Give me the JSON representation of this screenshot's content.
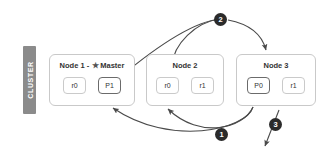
{
  "diagram": {
    "cluster_label": "CLUSTER",
    "colors": {
      "cluster_bar": "#8b8b8b",
      "node_border": "#c9c9c9",
      "primary_shard_border": "#6b6b6b",
      "replica_shard_border": "#cacaca",
      "arrow": "#4a4a4a",
      "marker_fill": "#2b2b2b",
      "marker_text": "#ffffff",
      "background": "#ffffff"
    },
    "nodes": [
      {
        "id": "node-1",
        "title": "Node 1 - ",
        "star": "★",
        "role": "Master",
        "shards": [
          {
            "label": "r0",
            "type": "replica"
          },
          {
            "label": "P1",
            "type": "primary"
          }
        ]
      },
      {
        "id": "node-2",
        "title": "Node 2",
        "star": "",
        "role": "",
        "shards": [
          {
            "label": "r0",
            "type": "replica"
          },
          {
            "label": "r1",
            "type": "replica"
          }
        ]
      },
      {
        "id": "node-3",
        "title": "Node 3",
        "star": "",
        "role": "",
        "shards": [
          {
            "label": "P0",
            "type": "primary"
          },
          {
            "label": "r1",
            "type": "replica"
          }
        ]
      }
    ],
    "steps": [
      {
        "number": "1",
        "name": "step-marker-1"
      },
      {
        "number": "2",
        "name": "step-marker-2"
      },
      {
        "number": "3",
        "name": "step-marker-3"
      }
    ]
  }
}
